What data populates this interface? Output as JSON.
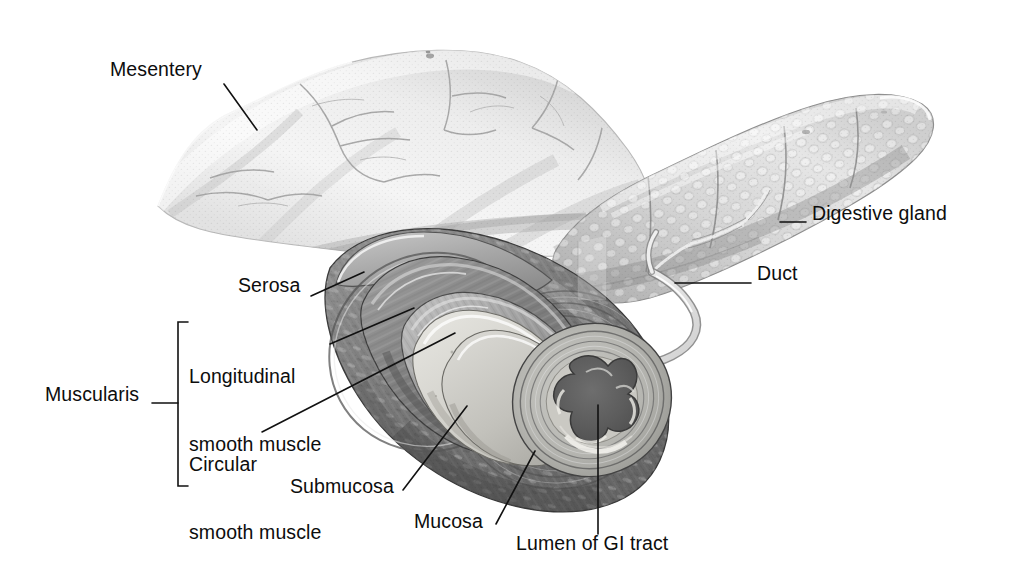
{
  "figure": {
    "style": "grayscale medical illustration, pen-and-wash",
    "background_color": "#ffffff",
    "label_color": "#0d0d0d",
    "leader_line_color": "#111111"
  },
  "labels": [
    {
      "id": "mesentery",
      "text": "Mesentery",
      "x": 110,
      "y": 68,
      "leader": {
        "from": [
          224,
          84
        ],
        "to": [
          257,
          130
        ]
      }
    },
    {
      "id": "digestive-gland",
      "text": "Digestive gland",
      "x": 812,
      "y": 212,
      "leader": {
        "from": [
          780,
          222
        ],
        "to": [
          806,
          222
        ]
      }
    },
    {
      "id": "duct",
      "text": "Duct",
      "x": 757,
      "y": 272,
      "leader": {
        "from": [
          675,
          283
        ],
        "to": [
          751,
          283
        ]
      }
    },
    {
      "id": "serosa",
      "text": "Serosa",
      "x": 238,
      "y": 284,
      "leader": {
        "from": [
          311,
          296
        ],
        "to": [
          364,
          272
        ]
      }
    },
    {
      "id": "longitudinal-smooth-muscle",
      "line1": "Longitudinal",
      "line2": "smooth muscle",
      "x": 189,
      "y": 330,
      "leader": {
        "from": [
          330,
          344
        ],
        "to": [
          414,
          308
        ]
      }
    },
    {
      "id": "circular-smooth-muscle",
      "line1": "Circular",
      "line2": "smooth muscle",
      "x": 189,
      "y": 418,
      "leader": {
        "from": [
          262,
          432
        ],
        "to": [
          455,
          333
        ]
      }
    },
    {
      "id": "muscularis",
      "text": "Muscularis",
      "x": 45,
      "y": 393,
      "leader": {
        "from": [
          152,
          403
        ],
        "to": [
          178,
          403
        ]
      }
    },
    {
      "id": "submucosa",
      "text": "Submucosa",
      "x": 290,
      "y": 485,
      "leader": {
        "from": [
          403,
          490
        ],
        "to": [
          467,
          406
        ]
      }
    },
    {
      "id": "mucosa",
      "text": "Mucosa",
      "x": 414,
      "y": 520,
      "leader": {
        "from": [
          496,
          524
        ],
        "to": [
          535,
          451
        ]
      }
    },
    {
      "id": "lumen-of-gi-tract",
      "text": "Lumen of GI tract",
      "x": 516,
      "y": 542,
      "leader": {
        "from": [
          598,
          534
        ],
        "to": [
          598,
          405
        ]
      }
    }
  ],
  "structures": [
    {
      "name": "mesentery",
      "description": "pale fan-shaped membranous sheet with fine branching blood vessels, upper left"
    },
    {
      "name": "digestive-gland",
      "description": "elongated lobulated gland with cobblestone acinar texture, upper right"
    },
    {
      "name": "duct",
      "description": "pale tubular duct running from the gland into the gut wall"
    },
    {
      "name": "serosa",
      "description": "thin outermost smooth layer of the gut tube"
    },
    {
      "name": "longitudinal-smooth-muscle",
      "description": "outer muscle layer of the muscularis, fibers running lengthwise"
    },
    {
      "name": "circular-smooth-muscle",
      "description": "inner muscle layer of the muscularis, fibers running around the tube"
    },
    {
      "name": "submucosa",
      "description": "pale connective tissue layer beneath the mucosa"
    },
    {
      "name": "mucosa",
      "description": "innermost lining layer, folded into the lumen"
    },
    {
      "name": "lumen-of-gi-tract",
      "description": "dark irregular star-shaped central cavity of the gut tube"
    }
  ],
  "palette": {
    "paper": "#ffffff",
    "mesentery_light": "#f2f2f2",
    "mesentery_shade": "#d2d2d2",
    "gland_light": "#dcdcdc",
    "gland_shade": "#9a9a9a",
    "serosa": "#b4b4b4",
    "longitudinal_muscle": "#8f8f8f",
    "circular_muscle": "#a8a8a8",
    "submucosa": "#d8d8d4",
    "mucosa": "#c3c3bf",
    "lumen_dark": "#5a5a5a",
    "outline": "#2c2c2c"
  }
}
